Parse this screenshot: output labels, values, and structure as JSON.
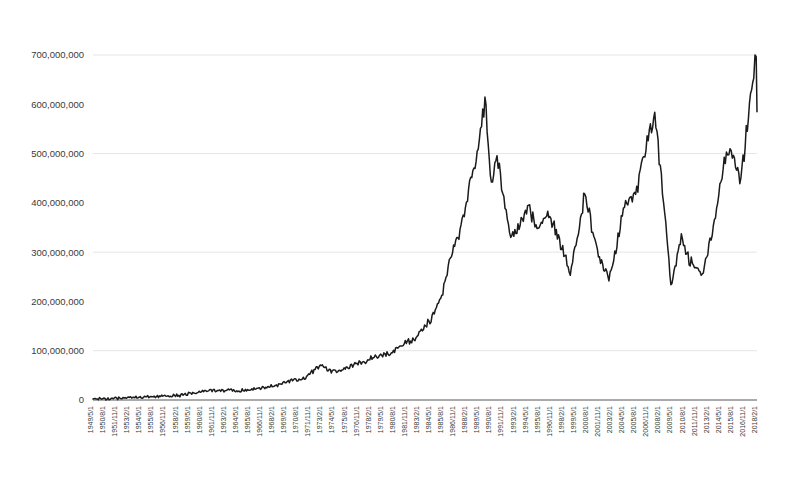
{
  "chart_data": {
    "type": "line",
    "title": "",
    "subtitle": "",
    "xlabel": "",
    "ylabel": "",
    "ylim": [
      0,
      700000000
    ],
    "ytick_labels": [
      "700,000,000",
      "600,000,000",
      "500,000,000",
      "400,000,000",
      "300,000,000",
      "200,000,000",
      "100,000,000",
      "0"
    ],
    "ytick_values": [
      700000000,
      600000000,
      500000000,
      400000000,
      300000000,
      200000000,
      100000000,
      0
    ],
    "grid": "horizontal",
    "legend": "none",
    "x_tick_interval_months": 15,
    "x_first_label": "1949/5/1",
    "x_last_label": "2018/2/1",
    "xtick_labels": [
      "1949/5/1",
      "1950/8/1",
      "1951/11/1",
      "1953/2/1",
      "1954/5/1",
      "1955/8/1",
      "1956/11/1",
      "1958/2/1",
      "1959/5/1",
      "1960/8/1",
      "1961/11/1",
      "1963/2/1",
      "1964/5/1",
      "1965/8/1",
      "1966/11/1",
      "1968/2/1",
      "1969/5/1",
      "1970/8/1",
      "1971/11/1",
      "1973/2/1",
      "1974/5/1",
      "1975/8/1",
      "1976/11/1",
      "1978/2/1",
      "1979/5/1",
      "1980/8/1",
      "1981/11/1",
      "1983/2/1",
      "1984/5/1",
      "1985/8/1",
      "1986/11/1",
      "1988/2/1",
      "1989/5/1",
      "1990/8/1",
      "1991/11/1",
      "1993/2/1",
      "1994/5/1",
      "1995/8/1",
      "1996/11/1",
      "1998/2/1",
      "1999/5/1",
      "2000/8/1",
      "2001/11/1",
      "2003/2/1",
      "2004/5/1",
      "2005/8/1",
      "2006/11/1",
      "2008/2/1",
      "2009/5/1",
      "2010/8/1",
      "2011/11/1",
      "2013/2/1",
      "2014/5/1",
      "2015/8/1",
      "2016/11/1",
      "2018/2/1"
    ],
    "series": [
      {
        "name": "value",
        "color": "#1b1b1b",
        "x": [
          "1949/5",
          "1950/5",
          "1951/5",
          "1952/5",
          "1953/5",
          "1954/5",
          "1955/5",
          "1956/5",
          "1957/5",
          "1958/5",
          "1959/5",
          "1960/5",
          "1961/5",
          "1962/5",
          "1963/5",
          "1964/5",
          "1965/5",
          "1966/5",
          "1967/5",
          "1968/5",
          "1969/5",
          "1970/5",
          "1971/5",
          "1972/5",
          "1973/2",
          "1973/8",
          "1974/5",
          "1975/5",
          "1976/5",
          "1977/5",
          "1978/5",
          "1979/5",
          "1980/5",
          "1981/5",
          "1982/5",
          "1983/5",
          "1984/5",
          "1985/5",
          "1986/5",
          "1987/5",
          "1988/5",
          "1989/5",
          "1989/12",
          "1990/8",
          "1991/3",
          "1992/8",
          "1993/5",
          "1994/5",
          "1995/6",
          "1996/6",
          "1997/6",
          "1998/10",
          "1999/8",
          "2000/4",
          "2001/9",
          "2002/10",
          "2003/4",
          "2004/4",
          "2005/10",
          "2006/4",
          "2007/7",
          "2008/10",
          "2009/3",
          "2010/4",
          "2011/3",
          "2012/6",
          "2013/5",
          "2014/12",
          "2015/6",
          "2016/6",
          "2017/10",
          "2018/1",
          "2018/2"
        ],
        "values": [
          1800000,
          2500000,
          3500000,
          4200000,
          5600000,
          5200000,
          6400000,
          8200000,
          8600000,
          9200000,
          13000000,
          16000000,
          20000000,
          18000000,
          21000000,
          19000000,
          20000000,
          23000000,
          25000000,
          30000000,
          38000000,
          40000000,
          45000000,
          62000000,
          72000000,
          60000000,
          58000000,
          62000000,
          72000000,
          76000000,
          86000000,
          92000000,
          96000000,
          115000000,
          120000000,
          140000000,
          165000000,
          205000000,
          285000000,
          345000000,
          430000000,
          530000000,
          610000000,
          430000000,
          490000000,
          330000000,
          350000000,
          395000000,
          340000000,
          385000000,
          335000000,
          255000000,
          345000000,
          420000000,
          290000000,
          250000000,
          280000000,
          390000000,
          430000000,
          490000000,
          580000000,
          330000000,
          230000000,
          330000000,
          280000000,
          255000000,
          330000000,
          500000000,
          510000000,
          450000000,
          660000000,
          705000000,
          585000000
        ]
      }
    ],
    "annotations": {
      "bubble_peak_label": "1989 peak ≈ 610,000,000",
      "crash_low_label": "2009 low ≈ 230,000,000",
      "recent_high_label": "2018 high ≈ 705,000,000"
    }
  }
}
